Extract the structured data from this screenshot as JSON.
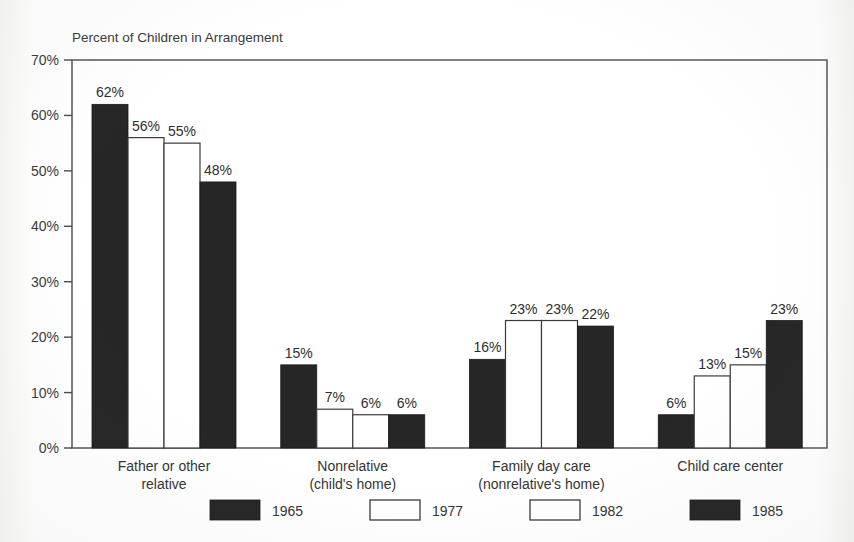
{
  "figure": {
    "axis_title": "Percent of Children in Arrangement",
    "background_color": "#fefefe",
    "ink_color": "#2b2b2b"
  },
  "chart_data": {
    "type": "bar",
    "title": "Percent of Children in Arrangement",
    "xlabel": "",
    "ylabel": "Percent of Children in Arrangement",
    "ylim": [
      0,
      70
    ],
    "ytick_values": [
      0,
      10,
      20,
      30,
      40,
      50,
      60,
      70
    ],
    "ytick_labels": [
      "0%",
      "10%",
      "20%",
      "30%",
      "40%",
      "50%",
      "60%",
      "70%"
    ],
    "grid": false,
    "legend_position": "bottom",
    "value_label_suffix": "%",
    "categories": [
      "Father or other relative",
      "Nonrelative (child's home)",
      "Family day care (nonrelative's home)",
      "Child care center"
    ],
    "category_label_lines": [
      [
        "Father or other",
        "relative"
      ],
      [
        "Nonrelative",
        "(child's home)"
      ],
      [
        "Family day care",
        "(nonrelative's home)"
      ],
      [
        "Child care center"
      ]
    ],
    "series": [
      {
        "name": "1965",
        "fill": "dark",
        "color": "#262626",
        "values": [
          62,
          15,
          16,
          6
        ]
      },
      {
        "name": "1977",
        "fill": "light",
        "color": "#ffffff",
        "values": [
          56,
          7,
          23,
          13
        ]
      },
      {
        "name": "1982",
        "fill": "light",
        "color": "#ffffff",
        "values": [
          55,
          6,
          23,
          15
        ]
      },
      {
        "name": "1985",
        "fill": "dark",
        "color": "#262626",
        "values": [
          48,
          6,
          22,
          23
        ]
      }
    ],
    "value_labels": [
      [
        "62%",
        "56%",
        "55%",
        "48%"
      ],
      [
        "15%",
        "7%",
        "6%",
        "6%"
      ],
      [
        "16%",
        "23%",
        "23%",
        "22%"
      ],
      [
        "6%",
        "13%",
        "15%",
        "23%"
      ]
    ]
  },
  "legend": {
    "entries": [
      {
        "label": "1965",
        "fill": "dark"
      },
      {
        "label": "1977",
        "fill": "light"
      },
      {
        "label": "1982",
        "fill": "light"
      },
      {
        "label": "1985",
        "fill": "dark"
      }
    ]
  }
}
